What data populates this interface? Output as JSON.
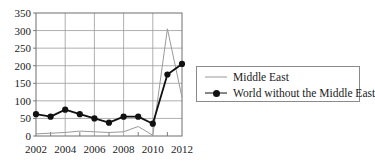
{
  "chart_data": {
    "type": "line",
    "title": "",
    "xlabel": "",
    "ylabel": "",
    "x": [
      2002,
      2003,
      2004,
      2005,
      2006,
      2007,
      2008,
      2009,
      2010,
      2011,
      2012
    ],
    "xlim": [
      2002,
      2012
    ],
    "ylim": [
      0,
      350
    ],
    "xticks": [
      2002,
      2003,
      2004,
      2005,
      2006,
      2007,
      2008,
      2009,
      2010,
      2011,
      2012
    ],
    "xticklabels": [
      "2002",
      "",
      "2004",
      "",
      "2006",
      "",
      "2008",
      "",
      "2010",
      "",
      "2012"
    ],
    "yticks": [
      0,
      50,
      100,
      150,
      200,
      250,
      300,
      350
    ],
    "yticklabels": [
      "0",
      "50",
      "100",
      "150",
      "200",
      "250",
      "300",
      "350"
    ],
    "grid": "horizontal-and-vertical-major",
    "legend_position": "right",
    "series": [
      {
        "name": "Middle East",
        "color": "#9a9a9a",
        "marker": "none",
        "values": [
          6,
          8,
          10,
          14,
          12,
          10,
          12,
          27,
          2,
          305,
          110
        ]
      },
      {
        "name": "World without the Middle East",
        "color": "#111111",
        "marker": "filled-circle",
        "values": [
          62,
          55,
          75,
          62,
          50,
          38,
          55,
          55,
          35,
          175,
          205
        ]
      }
    ]
  },
  "legend": {
    "entries": [
      {
        "label": "Middle East"
      },
      {
        "label": "World without the Middle East"
      }
    ]
  },
  "colors": {
    "axis": "#6f6f6f",
    "grid": "#9a9a9a",
    "background": "#ffffff",
    "series_middle_east": "#9a9a9a",
    "series_world": "#111111"
  }
}
